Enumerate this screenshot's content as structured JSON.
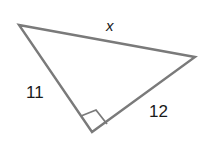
{
  "diagram": {
    "type": "right-triangle",
    "colors": {
      "stroke": "#7a7a7a",
      "label": "#1a1a1a",
      "background": "#ffffff"
    },
    "vertices": {
      "top_left": [
        19,
        25
      ],
      "right": [
        195,
        57
      ],
      "bottom": [
        92,
        132
      ]
    },
    "right_angle_at": "bottom",
    "sides": {
      "hypotenuse": {
        "label": "x"
      },
      "left_leg": {
        "label": "11"
      },
      "right_leg": {
        "label": "12"
      }
    }
  }
}
